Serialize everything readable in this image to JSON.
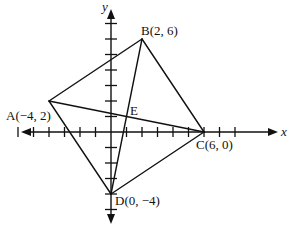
{
  "figure": {
    "type": "coordinate-geometry-quadrilateral",
    "axes": {
      "x_label": "x",
      "y_label": "y",
      "x_tick_range": [
        -6,
        8
      ],
      "y_tick_range": [
        -5,
        7
      ],
      "unit_px": 15.5,
      "origin_px": [
        111,
        132
      ]
    },
    "points": [
      {
        "id": "A",
        "label": "A(−4, 2)",
        "x": -4,
        "y": 2
      },
      {
        "id": "B",
        "label": "B(2, 6)",
        "x": 2,
        "y": 6
      },
      {
        "id": "C",
        "label": "C(6, 0)",
        "x": 6,
        "y": 0
      },
      {
        "id": "D",
        "label": "D(0, −4)",
        "x": 0,
        "y": -4
      },
      {
        "id": "E",
        "label": "E",
        "x": 1,
        "y": 1
      }
    ],
    "segments": [
      [
        "A",
        "B"
      ],
      [
        "B",
        "C"
      ],
      [
        "C",
        "D"
      ],
      [
        "D",
        "A"
      ],
      [
        "A",
        "C"
      ],
      [
        "B",
        "D"
      ]
    ],
    "colors": {
      "line": "#111111",
      "background": "#ffffff"
    }
  }
}
